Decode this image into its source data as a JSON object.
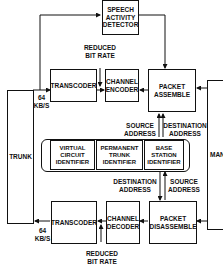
{
  "diagram": {
    "blocks": {
      "speech_activity_detector": "SPEECH\nACTIVITY\nDETECTOR",
      "transcoder_top": "TRANSCODER",
      "channel_encoder": "CHANNEL\nENCODER",
      "packet_assemble": "PACKET\nASSEMBLE",
      "transcoder_bottom": "TRANSCODER",
      "channel_decoder": "CHANNEL\nDECODER",
      "packet_disassemble": "PACKET\nDISASSEMBLE",
      "trunk": "TRUNK",
      "man": "MAN"
    },
    "identifiers": [
      "VIRTUAL\nCIRCUIT\nIDENTIFIER",
      "PERMANENT\nTRUNK\nIDENTIFIER",
      "BASE\nSTATION\nIDENTIFIER"
    ],
    "labels": {
      "reduced_bit_rate_top": "REDUCED\nBIT RATE",
      "reduced_bit_rate_bottom": "REDUCED\nBIT RATE",
      "rate_top": "64\nKB/S",
      "rate_bottom": "64\nKB/S",
      "source_address_top": "SOURCE\nADDRESS",
      "destination_address_top": "DESTINATION\nADDRESS",
      "destination_address_bottom": "DESTINATION\nADDRESS",
      "source_address_bottom": "SOURCE\nADDRESS"
    }
  }
}
